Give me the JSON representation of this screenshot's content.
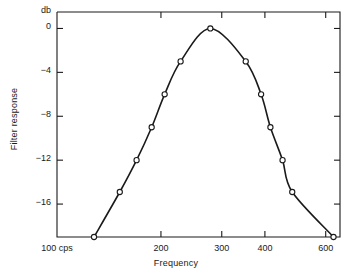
{
  "chart_data": {
    "type": "line",
    "title": "",
    "subtitle": "",
    "xlabel": "Frequency",
    "ylabel": "Filter response",
    "yunit": "db",
    "x_scale": "log",
    "y_scale": "linear",
    "xlim": [
      100,
      660
    ],
    "ylim": [
      -19,
      1.5
    ],
    "grid": false,
    "legend": null,
    "x_ticks": [
      {
        "value": 100,
        "label": "100 cps"
      },
      {
        "value": 200,
        "label": "200"
      },
      {
        "value": 300,
        "label": "300"
      },
      {
        "value": 400,
        "label": "400"
      },
      {
        "value": 600,
        "label": "600"
      }
    ],
    "y_ticks": [
      {
        "value": 0,
        "label": "0"
      },
      {
        "value": -4,
        "label": "−4"
      },
      {
        "value": -8,
        "label": "−8"
      },
      {
        "value": -12,
        "label": "−12"
      },
      {
        "value": -16,
        "label": "−16"
      }
    ],
    "series": [
      {
        "name": "Filter response",
        "marker": "open-circle",
        "line": "solid",
        "color": "#1a1a1a",
        "x": [
          128,
          152,
          170,
          188,
          205,
          228,
          278,
          352,
          390,
          415,
          450,
          480,
          520,
          575,
          632
        ],
        "y": [
          -19.0,
          -14.9,
          -12.0,
          -9.0,
          -6.0,
          -3.0,
          0.0,
          -3.0,
          -6.0,
          -9.0,
          -12.0,
          -14.9,
          -19.0,
          -19.0,
          -19.0
        ],
        "points": [
          {
            "x": 128,
            "y": -19.0
          },
          {
            "x": 152,
            "y": -14.9
          },
          {
            "x": 170,
            "y": -12.0
          },
          {
            "x": 188,
            "y": -9.0
          },
          {
            "x": 205,
            "y": -6.0
          },
          {
            "x": 228,
            "y": -3.0
          },
          {
            "x": 278,
            "y": 0.0
          },
          {
            "x": 352,
            "y": -3.0
          },
          {
            "x": 390,
            "y": -6.0
          },
          {
            "x": 415,
            "y": -9.0
          },
          {
            "x": 450,
            "y": -12.0
          },
          {
            "x": 480,
            "y": -14.9
          },
          {
            "x": 632,
            "y": -19.0
          }
        ]
      }
    ]
  },
  "axes": {
    "y_unit_label": "db",
    "x_axis_title": "Frequency",
    "y_axis_title": "Filter response"
  }
}
